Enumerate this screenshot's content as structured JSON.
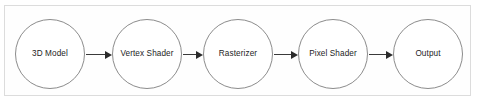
{
  "diagram": {
    "frame": {
      "border_color": "#dcdcdc",
      "background_color": "#fefefe"
    },
    "style": {
      "node_border_color": "#8c8c8c",
      "node_fill_color": "#ffffff",
      "label_color": "#1d1d1d",
      "arrow_color": "#2b2b2b",
      "page_background": "#ffffff"
    },
    "nodes": [
      {
        "id": "model",
        "label": "3D Model"
      },
      {
        "id": "vertex-shader",
        "label": "Vertex Shader"
      },
      {
        "id": "rasterizer",
        "label": "Rasterizer"
      },
      {
        "id": "pixel-shader",
        "label": "Pixel Shader"
      },
      {
        "id": "output",
        "label": "Output"
      }
    ],
    "connectors": [
      {
        "from": "3D Model",
        "to": "Vertex Shader",
        "style": "arrow-right"
      },
      {
        "from": "Vertex Shader",
        "to": "Rasterizer",
        "style": "arrow-right"
      },
      {
        "from": "Rasterizer",
        "to": "Pixel Shader",
        "style": "arrow-right"
      },
      {
        "from": "Pixel Shader",
        "to": "Output",
        "style": "arrow-right"
      }
    ]
  }
}
